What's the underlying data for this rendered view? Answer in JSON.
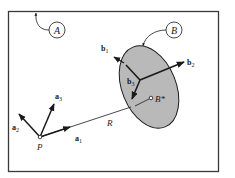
{
  "diagram": {
    "frames": {
      "A": {
        "label": "A",
        "description": "reference frame A"
      },
      "B": {
        "label": "B",
        "description": "rigid body B"
      }
    },
    "points": {
      "P": "P",
      "B_star": "B*"
    },
    "vectors": {
      "a1": {
        "base": "a",
        "sub": "1"
      },
      "a2": {
        "base": "a",
        "sub": "2"
      },
      "a3": {
        "base": "a",
        "sub": "3"
      },
      "b1": {
        "base": "b",
        "sub": "1"
      },
      "b2": {
        "base": "b",
        "sub": "2"
      },
      "b3": {
        "base": "b",
        "sub": "3"
      }
    },
    "position_label": "R",
    "colors": {
      "border": "#3a3a3a",
      "body_fill": "#b9b9b9",
      "ink": "#1a1a1a",
      "background": "#ffffff"
    }
  }
}
